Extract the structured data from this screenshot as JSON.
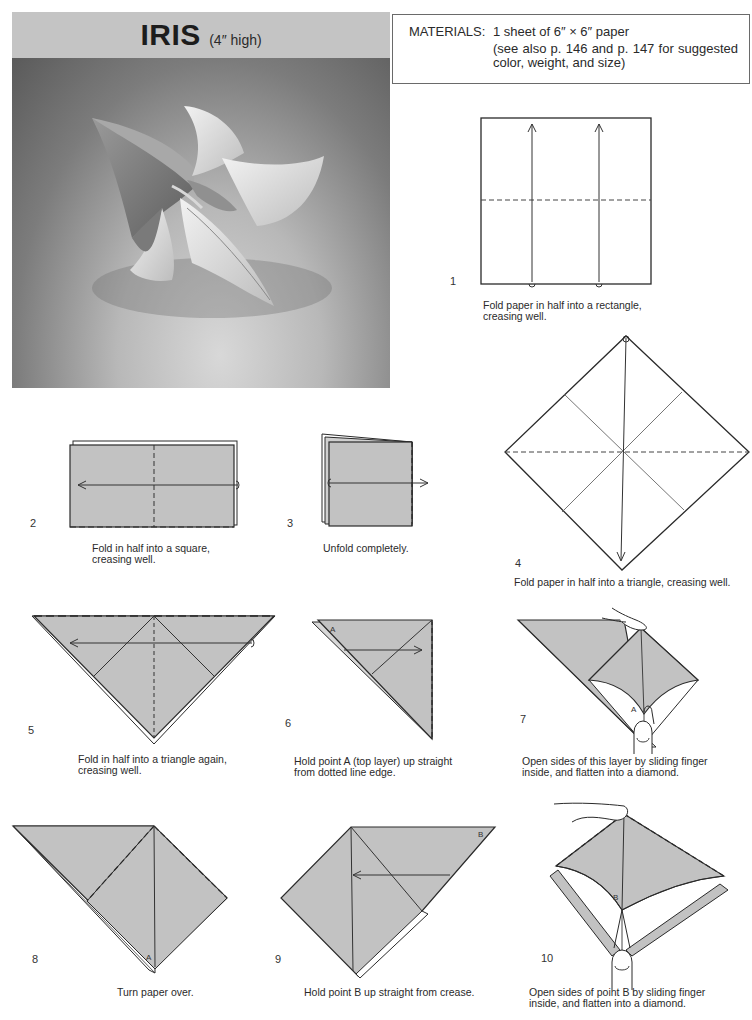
{
  "header": {
    "title": "IRIS",
    "subtitle": "(4″ high)"
  },
  "materials": {
    "label": "MATERIALS:",
    "line1": "1 sheet of 6″ × 6″ paper",
    "line2": "(see also p. 146 and p. 147 for suggested color, weight, and size)"
  },
  "photo": {
    "alt": "Photograph of folded paper iris flower"
  },
  "colors": {
    "paper_fill": "#c2c2c2",
    "line": "#2a2a2a",
    "title_band": "#c4c4c4"
  },
  "steps": [
    {
      "number": "1",
      "caption_l1": "Fold paper in half into a rectangle,",
      "caption_l2": "creasing well."
    },
    {
      "number": "2",
      "caption_l1": "Fold in half into a square,",
      "caption_l2": "creasing well."
    },
    {
      "number": "3",
      "caption_l1": "Unfold completely.",
      "caption_l2": ""
    },
    {
      "number": "4",
      "caption_l1": "Fold paper in half into a triangle, creasing well.",
      "caption_l2": ""
    },
    {
      "number": "5",
      "caption_l1": "Fold in half into a triangle again,",
      "caption_l2": "creasing well."
    },
    {
      "number": "6",
      "caption_l1": "Hold point A (top layer) up straight",
      "caption_l2": "from dotted line edge."
    },
    {
      "number": "7",
      "caption_l1": "Open sides of this layer by sliding finger",
      "caption_l2": "inside, and flatten into a diamond."
    },
    {
      "number": "8",
      "caption_l1": "Turn paper over.",
      "caption_l2": ""
    },
    {
      "number": "9",
      "caption_l1": "Hold point B up straight from crease.",
      "caption_l2": ""
    },
    {
      "number": "10",
      "caption_l1": "Open sides of point B by sliding finger",
      "caption_l2": "inside, and flatten into a diamond."
    }
  ],
  "labels": {
    "point_a": "A",
    "point_b": "B"
  }
}
